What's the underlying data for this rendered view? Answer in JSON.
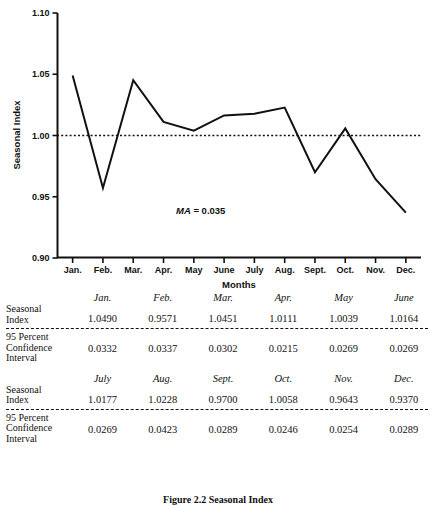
{
  "chart_data": {
    "type": "line",
    "title": "",
    "xlabel": "Months",
    "ylabel": "Seasonal Index",
    "categories": [
      "Jan.",
      "Feb.",
      "Mar.",
      "Apr.",
      "May",
      "June",
      "July",
      "Aug.",
      "Sept.",
      "Oct.",
      "Nov.",
      "Dec."
    ],
    "values": [
      1.049,
      0.9571,
      1.0451,
      1.0111,
      1.0039,
      1.0164,
      1.0177,
      1.0228,
      0.97,
      1.0058,
      0.9643,
      0.937
    ],
    "ylim": [
      0.9,
      1.1
    ],
    "ytick_labels": [
      "1.10",
      "1.05",
      "1.00",
      "0.95",
      "0.90"
    ],
    "ytick_values": [
      1.1,
      1.05,
      1.0,
      0.95,
      0.9
    ],
    "grid": false,
    "legend": "none",
    "reference_line": {
      "value": 1.0,
      "style": "dotted"
    },
    "annotation": {
      "prefix": "MA",
      "text": " = 0.035"
    },
    "line_color": "#111111"
  },
  "table": {
    "row_labels": {
      "seasonal_index": [
        "Seasonal",
        "Index"
      ],
      "confidence": [
        "95 Percent",
        "Confidence",
        "Interval"
      ]
    },
    "blocks": [
      {
        "months": [
          "Jan.",
          "Feb.",
          "Mar.",
          "Apr.",
          "May",
          "June"
        ],
        "seasonal_index": [
          "1.0490",
          "0.9571",
          "1.0451",
          "1.0111",
          "1.0039",
          "1.0164"
        ],
        "confidence_interval": [
          "0.0332",
          "0.0337",
          "0.0302",
          "0.0215",
          "0.0269",
          "0.0269"
        ]
      },
      {
        "months": [
          "July",
          "Aug.",
          "Sept.",
          "Oct.",
          "Nov.",
          "Dec."
        ],
        "seasonal_index": [
          "1.0177",
          "1.0228",
          "0.9700",
          "1.0058",
          "0.9643",
          "0.9370"
        ],
        "confidence_interval": [
          "0.0269",
          "0.0423",
          "0.0289",
          "0.0246",
          "0.0254",
          "0.0289"
        ]
      }
    ]
  },
  "caption": "Figure 2.2 Seasonal Index"
}
